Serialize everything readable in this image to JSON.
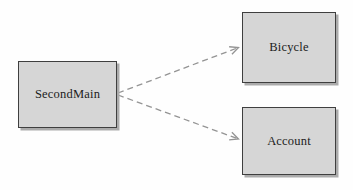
{
  "diagram": {
    "type": "uml-dependency-diagram",
    "nodes": [
      {
        "id": "secondmain",
        "label": "SecondMain"
      },
      {
        "id": "bicycle",
        "label": "Bicycle"
      },
      {
        "id": "account",
        "label": "Account"
      }
    ],
    "edges": [
      {
        "from": "secondmain",
        "to": "bicycle",
        "style": "dashed",
        "arrowhead": "open"
      },
      {
        "from": "secondmain",
        "to": "account",
        "style": "dashed",
        "arrowhead": "open"
      }
    ],
    "colors": {
      "background": "#fefefe",
      "node_fill": "#d6d6d6",
      "node_border": "#3f3f3f",
      "node_shadow": "#ababab",
      "edge_stroke": "#949494",
      "label_text": "#1c1c1c"
    }
  }
}
